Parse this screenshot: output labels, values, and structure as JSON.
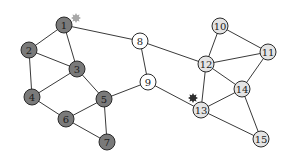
{
  "diagram": {
    "type": "graph",
    "colors": {
      "group_dark": "#7a7a7a",
      "group_white": "#ffffff",
      "group_light": "#e4e4e4",
      "edge": "#3a3a3a",
      "star_gray": "#a8a8a8",
      "star_dark": "#2e2e2e"
    },
    "nodes": [
      {
        "id": "1",
        "label": "1",
        "x": 64,
        "y": 25,
        "group": "dark"
      },
      {
        "id": "2",
        "label": "2",
        "x": 29,
        "y": 50,
        "group": "dark"
      },
      {
        "id": "3",
        "label": "3",
        "x": 77,
        "y": 69,
        "group": "dark"
      },
      {
        "id": "4",
        "label": "4",
        "x": 32,
        "y": 97,
        "group": "dark"
      },
      {
        "id": "5",
        "label": "5",
        "x": 104,
        "y": 99,
        "group": "dark"
      },
      {
        "id": "6",
        "label": "6",
        "x": 66,
        "y": 119,
        "group": "dark"
      },
      {
        "id": "7",
        "label": "7",
        "x": 107,
        "y": 142,
        "group": "dark"
      },
      {
        "id": "8",
        "label": "8",
        "x": 140,
        "y": 41,
        "group": "white"
      },
      {
        "id": "9",
        "label": "9",
        "x": 148,
        "y": 82,
        "group": "white"
      },
      {
        "id": "10",
        "label": "10",
        "x": 220,
        "y": 26,
        "group": "light"
      },
      {
        "id": "11",
        "label": "11",
        "x": 268,
        "y": 52,
        "group": "light"
      },
      {
        "id": "12",
        "label": "12",
        "x": 206,
        "y": 64,
        "group": "light"
      },
      {
        "id": "13",
        "label": "13",
        "x": 201,
        "y": 110,
        "group": "light"
      },
      {
        "id": "14",
        "label": "14",
        "x": 242,
        "y": 89,
        "group": "light"
      },
      {
        "id": "15",
        "label": "15",
        "x": 261,
        "y": 139,
        "group": "light"
      }
    ],
    "edges": [
      [
        "1",
        "2"
      ],
      [
        "1",
        "3"
      ],
      [
        "1",
        "8"
      ],
      [
        "2",
        "3"
      ],
      [
        "2",
        "4"
      ],
      [
        "3",
        "4"
      ],
      [
        "3",
        "5"
      ],
      [
        "4",
        "6"
      ],
      [
        "5",
        "6"
      ],
      [
        "5",
        "7"
      ],
      [
        "6",
        "7"
      ],
      [
        "5",
        "9"
      ],
      [
        "8",
        "9"
      ],
      [
        "8",
        "12"
      ],
      [
        "9",
        "13"
      ],
      [
        "10",
        "12"
      ],
      [
        "10",
        "11"
      ],
      [
        "11",
        "12"
      ],
      [
        "11",
        "14"
      ],
      [
        "12",
        "14"
      ],
      [
        "12",
        "13"
      ],
      [
        "13",
        "14"
      ],
      [
        "13",
        "15"
      ],
      [
        "14",
        "15"
      ]
    ],
    "markers": [
      {
        "name": "gray-star",
        "x": 76,
        "y": 18,
        "color": "#a8a8a8"
      },
      {
        "name": "dark-star",
        "x": 193,
        "y": 98,
        "color": "#2e2e2e"
      }
    ]
  }
}
